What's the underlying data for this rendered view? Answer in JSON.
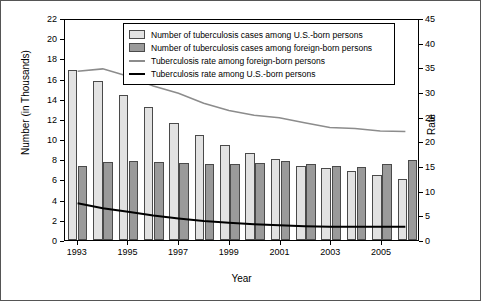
{
  "chart_data": {
    "type": "bar",
    "title": "",
    "xlabel": "Year",
    "ylabel": "Number (in Thousands)",
    "y2label": "Rate",
    "ylim": [
      0,
      22
    ],
    "y2lim": [
      0,
      45
    ],
    "yticks": [
      0,
      2,
      4,
      6,
      8,
      10,
      12,
      14,
      16,
      18,
      20,
      22
    ],
    "y2ticks": [
      0,
      5,
      10,
      15,
      20,
      25,
      30,
      35,
      40,
      45
    ],
    "x": [
      1993,
      1994,
      1995,
      1996,
      1997,
      1998,
      1999,
      2000,
      2001,
      2002,
      2003,
      2004,
      2005,
      2006
    ],
    "xticks": [
      1993,
      1995,
      1997,
      1999,
      2001,
      2003,
      2005
    ],
    "grid": false,
    "legend_position": "top-center",
    "series": [
      {
        "name": "Number of tuberculosis cases among U.S.-born persons",
        "type": "bar",
        "axis": "left",
        "color": "#e2e2e2",
        "values": [
          16.8,
          15.8,
          14.4,
          13.2,
          11.6,
          10.4,
          9.4,
          8.6,
          8.0,
          7.3,
          7.1,
          6.8,
          6.4,
          6.0
        ]
      },
      {
        "name": "Number of tuberculosis cases among foreign-born persons",
        "type": "bar",
        "axis": "left",
        "color": "#9a9a9a",
        "values": [
          7.3,
          7.7,
          7.8,
          7.7,
          7.6,
          7.5,
          7.5,
          7.6,
          7.8,
          7.5,
          7.3,
          7.2,
          7.5,
          7.9
        ]
      },
      {
        "name": "Tuberculosis rate among foreign-born persons",
        "type": "line",
        "axis": "right",
        "color": "#8c8c8c",
        "values": [
          34.5,
          35.0,
          33.5,
          31.5,
          30.0,
          28.0,
          26.5,
          25.5,
          25.0,
          24.0,
          23.0,
          22.8,
          22.3,
          22.2
        ]
      },
      {
        "name": "Tuberculosis rate among U.S.-born persons",
        "type": "line",
        "axis": "right",
        "color": "#000000",
        "values": [
          7.5,
          6.5,
          5.8,
          5.0,
          4.4,
          3.9,
          3.5,
          3.2,
          3.0,
          2.8,
          2.7,
          2.7,
          2.7,
          2.7
        ]
      }
    ]
  },
  "legend": {
    "items": [
      {
        "label": "Number of tuberculosis cases among U.S.-born persons",
        "marker": "swatch-light"
      },
      {
        "label": "Number of tuberculosis cases among foreign-born persons",
        "marker": "swatch-dark"
      },
      {
        "label": "Tuberculosis rate among foreign-born persons",
        "marker": "line-gray"
      },
      {
        "label": "Tuberculosis rate among U.S.-born persons",
        "marker": "line-black"
      }
    ]
  },
  "axes": {
    "y_title": "Number (in Thousands)",
    "y2_title": "Rate",
    "x_title": "Year"
  }
}
